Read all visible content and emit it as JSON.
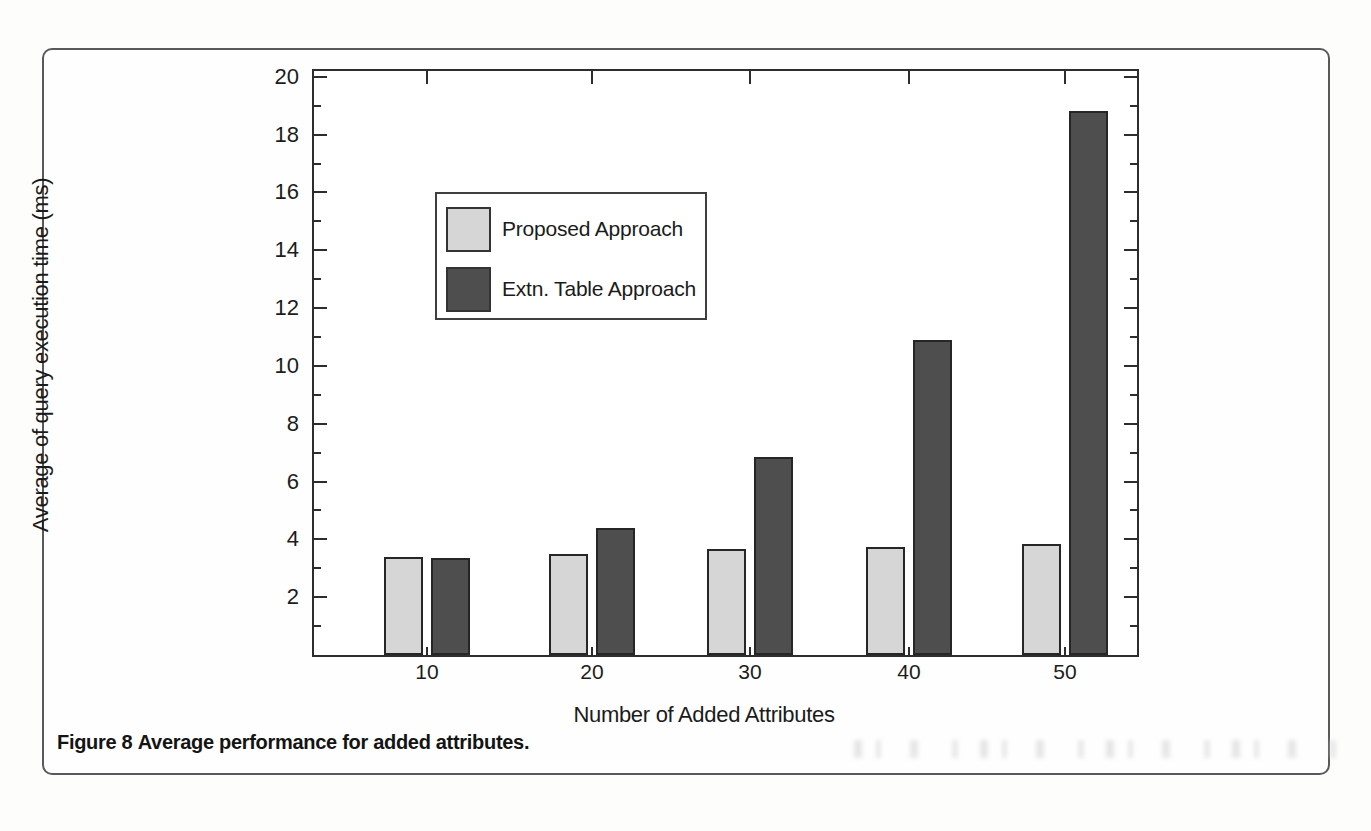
{
  "figure": {
    "caption_label": "Figure 8",
    "caption_text": "Average performance for added attributes.",
    "border_color": "#595959"
  },
  "chart_data": {
    "type": "bar",
    "title": "",
    "xlabel": "Number of Added Attributes",
    "ylabel": "Average of query execution time (ms)",
    "categories": [
      "10",
      "20",
      "30",
      "40",
      "50"
    ],
    "series": [
      {
        "name": "Proposed Approach",
        "color": "#d6d6d6",
        "values": [
          3.4,
          3.5,
          3.65,
          3.75,
          3.85
        ]
      },
      {
        "name": "Extn. Table Approach",
        "color": "#4e4e4e",
        "values": [
          3.35,
          4.4,
          6.85,
          10.9,
          18.8
        ]
      }
    ],
    "ylim": [
      0,
      20
    ],
    "y_major_ticks": [
      2,
      4,
      6,
      8,
      10,
      12,
      14,
      16,
      18,
      20
    ],
    "y_minor_ticks": [
      1,
      3,
      5,
      7,
      9,
      11,
      13,
      15,
      17,
      19
    ],
    "grid": false,
    "legend_position": "upper-left-inside",
    "bar_fill_light": "#d6d6d6",
    "bar_fill_dark": "#4e4e4e",
    "axis_color": "#2d2d2d",
    "text_color": "#1c1c1c"
  }
}
